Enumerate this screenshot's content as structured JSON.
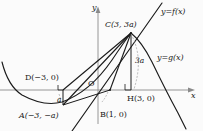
{
  "figure": {
    "type": "coordinate-geometry-diagram",
    "axes": {
      "x_label": "x",
      "y_label": "y",
      "origin_label": "O"
    },
    "curve_labels": {
      "line_label": "y=f(x)",
      "parabola_label": "y=g(x)"
    },
    "points": [
      {
        "key": "C",
        "label": "C(3, 3a)"
      },
      {
        "key": "D",
        "label": "D(−3, 0)"
      },
      {
        "key": "A",
        "label": "A(−3, −a)"
      },
      {
        "key": "B",
        "label": "B(1, 0)"
      },
      {
        "key": "H",
        "label": "H(3, 0)"
      }
    ],
    "segment_labels": {
      "short_side": "a",
      "tall_side": "3a"
    },
    "colors": {
      "ink": "#1a1a1a",
      "axis": "#7a7a7a",
      "dashed": "#9a9a9a",
      "background": "#fbfbfb"
    }
  }
}
